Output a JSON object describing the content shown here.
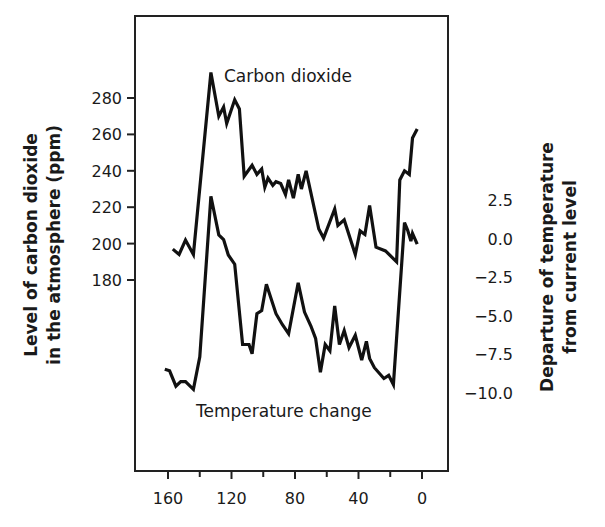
{
  "chart_data": {
    "type": "line",
    "title": "",
    "xlabel": "",
    "x_ticks": [
      160,
      120,
      80,
      40,
      0
    ],
    "x_minor_ticks": [
      140,
      100,
      60,
      20
    ],
    "xlim": [
      165,
      -5
    ],
    "x_reversed": true,
    "y_left": {
      "label_line1": "Level of carbon dioxide",
      "label_line2": "in the atmosphere (ppm)",
      "ticks": [
        280,
        260,
        240,
        220,
        200,
        180
      ]
    },
    "y_right": {
      "label_line1": "Departure of temperature",
      "label_line2": "from current level",
      "ticks": [
        "2.5",
        "0.0",
        "−2.5",
        "−5.0",
        "−7.5",
        "−10.0"
      ]
    },
    "grid": false,
    "legend": "inline labels",
    "series": [
      {
        "name": "Carbon dioxide",
        "axis": "left",
        "unit": "ppm",
        "label_text": "Carbon dioxide",
        "x": [
          157,
          153,
          149,
          144,
          133,
          128,
          125,
          123,
          118,
          115,
          112,
          107,
          104,
          101,
          99,
          97,
          94,
          92,
          89,
          86,
          84,
          81,
          78,
          76,
          73,
          65,
          62,
          55,
          53,
          49,
          42,
          39,
          36,
          33,
          29,
          23,
          16,
          14,
          11,
          8,
          6,
          3
        ],
        "values": [
          197,
          194,
          202,
          194,
          294,
          270,
          275,
          266,
          279,
          274,
          237,
          243,
          238,
          241,
          231,
          236,
          232,
          234,
          233,
          227,
          235,
          225,
          238,
          230,
          240,
          208,
          203,
          219,
          210,
          213,
          194,
          207,
          205,
          221,
          198,
          196,
          190,
          235,
          240,
          238,
          258,
          263
        ]
      },
      {
        "name": "Temperature change",
        "axis": "right",
        "unit": "°C departure",
        "label_text": "Temperature change",
        "x": [
          162,
          159,
          155,
          152,
          149,
          144,
          140,
          133,
          128,
          125,
          122,
          118,
          113,
          109,
          107,
          104,
          101,
          98,
          92,
          88,
          84,
          78,
          74,
          70,
          67,
          64,
          61,
          58,
          55,
          52,
          49,
          46,
          42,
          38,
          35,
          33,
          30,
          24,
          21,
          18,
          11,
          9,
          7,
          6,
          3
        ],
        "values": [
          -8.5,
          -8.6,
          -9.6,
          -9.3,
          -9.3,
          -9.8,
          -7.7,
          2.7,
          0.2,
          -0.1,
          -1.1,
          -1.7,
          -6.9,
          -6.9,
          -7.5,
          -4.9,
          -4.7,
          -3.0,
          -4.9,
          -5.6,
          -6.2,
          -2.9,
          -4.8,
          -5.7,
          -6.5,
          -8.7,
          -6.9,
          -7.3,
          -4.4,
          -6.9,
          -6.0,
          -7.1,
          -6.3,
          -7.9,
          -6.7,
          -7.8,
          -8.4,
          -9.1,
          -8.9,
          -9.5,
          1.0,
          0.5,
          -0.2,
          0.3,
          -0.4
        ]
      }
    ]
  }
}
